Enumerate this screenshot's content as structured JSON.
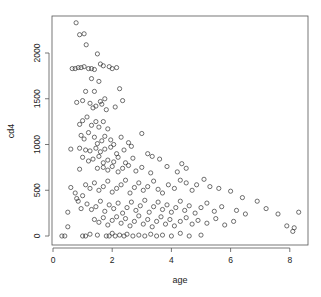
{
  "chart_data": {
    "type": "scatter",
    "title": "",
    "xlabel": "age",
    "ylabel": "cd4",
    "xlim": [
      -0.05,
      8.6
    ],
    "ylim": [
      -100,
      2420
    ],
    "xticks": [
      0,
      2,
      4,
      6,
      8
    ],
    "yticks": [
      0,
      500,
      1000,
      1500,
      2000
    ],
    "grid": false,
    "legend": null,
    "marker": "open-circle",
    "series": [
      {
        "name": "cd4 vs age",
        "points": [
          [
            0.78,
            2330
          ],
          [
            0.9,
            2200
          ],
          [
            1.05,
            2210
          ],
          [
            1.12,
            2090
          ],
          [
            1.5,
            1990
          ],
          [
            2.15,
            1840
          ],
          [
            0.65,
            1830
          ],
          [
            0.75,
            1830
          ],
          [
            0.85,
            1840
          ],
          [
            0.95,
            1840
          ],
          [
            1.05,
            1850
          ],
          [
            1.2,
            1830
          ],
          [
            1.3,
            1830
          ],
          [
            1.4,
            1820
          ],
          [
            1.6,
            1880
          ],
          [
            1.7,
            1860
          ],
          [
            1.9,
            1850
          ],
          [
            2.0,
            1830
          ],
          [
            1.3,
            1720
          ],
          [
            1.55,
            1690
          ],
          [
            1.4,
            1580
          ],
          [
            1.1,
            1580
          ],
          [
            1.0,
            1480
          ],
          [
            1.6,
            1470
          ],
          [
            1.75,
            1500
          ],
          [
            2.25,
            1610
          ],
          [
            0.8,
            1460
          ],
          [
            1.25,
            1450
          ],
          [
            1.35,
            1400
          ],
          [
            1.45,
            1420
          ],
          [
            1.65,
            1440
          ],
          [
            1.8,
            1380
          ],
          [
            2.1,
            1410
          ],
          [
            2.35,
            1480
          ],
          [
            0.9,
            1220
          ],
          [
            1.0,
            1260
          ],
          [
            1.15,
            1300
          ],
          [
            1.3,
            1210
          ],
          [
            1.45,
            1250
          ],
          [
            1.55,
            1190
          ],
          [
            1.7,
            1250
          ],
          [
            1.85,
            1170
          ],
          [
            0.95,
            1100
          ],
          [
            1.05,
            1060
          ],
          [
            1.2,
            1130
          ],
          [
            1.4,
            1080
          ],
          [
            1.5,
            1010
          ],
          [
            1.65,
            1040
          ],
          [
            1.75,
            1090
          ],
          [
            1.95,
            1050
          ],
          [
            2.05,
            1000
          ],
          [
            2.3,
            1080
          ],
          [
            2.55,
            1020
          ],
          [
            3.0,
            1120
          ],
          [
            0.6,
            950
          ],
          [
            0.9,
            960
          ],
          [
            1.1,
            940
          ],
          [
            1.25,
            930
          ],
          [
            1.45,
            960
          ],
          [
            1.6,
            920
          ],
          [
            1.75,
            950
          ],
          [
            1.95,
            970
          ],
          [
            2.15,
            900
          ],
          [
            2.4,
            940
          ],
          [
            2.65,
            980
          ],
          [
            3.2,
            900
          ],
          [
            1.0,
            860
          ],
          [
            1.2,
            820
          ],
          [
            1.35,
            840
          ],
          [
            1.55,
            870
          ],
          [
            1.7,
            800
          ],
          [
            1.85,
            830
          ],
          [
            2.05,
            810
          ],
          [
            2.2,
            860
          ],
          [
            2.45,
            800
          ],
          [
            2.7,
            850
          ],
          [
            3.35,
            870
          ],
          [
            3.6,
            840
          ],
          [
            0.9,
            730
          ],
          [
            1.5,
            740
          ],
          [
            1.7,
            750
          ],
          [
            1.85,
            720
          ],
          [
            2.0,
            760
          ],
          [
            2.2,
            700
          ],
          [
            2.35,
            740
          ],
          [
            2.55,
            770
          ],
          [
            2.8,
            710
          ],
          [
            3.0,
            750
          ],
          [
            3.3,
            690
          ],
          [
            3.85,
            760
          ],
          [
            4.35,
            790
          ],
          [
            4.5,
            740
          ],
          [
            4.2,
            700
          ],
          [
            0.6,
            530
          ],
          [
            0.75,
            470
          ],
          [
            0.85,
            380
          ],
          [
            1.0,
            440
          ],
          [
            0.8,
            410
          ],
          [
            1.1,
            560
          ],
          [
            1.25,
            520
          ],
          [
            1.4,
            580
          ],
          [
            1.55,
            500
          ],
          [
            1.7,
            540
          ],
          [
            1.85,
            600
          ],
          [
            2.0,
            480
          ],
          [
            2.15,
            520
          ],
          [
            2.3,
            560
          ],
          [
            2.45,
            610
          ],
          [
            2.6,
            470
          ],
          [
            2.75,
            530
          ],
          [
            2.9,
            580
          ],
          [
            3.05,
            500
          ],
          [
            3.2,
            540
          ],
          [
            3.4,
            600
          ],
          [
            3.55,
            510
          ],
          [
            3.7,
            470
          ],
          [
            3.9,
            560
          ],
          [
            4.1,
            520
          ],
          [
            4.3,
            610
          ],
          [
            4.5,
            580
          ],
          [
            4.7,
            500
          ],
          [
            4.85,
            560
          ],
          [
            5.1,
            620
          ],
          [
            5.3,
            540
          ],
          [
            5.6,
            520
          ],
          [
            6.0,
            490
          ],
          [
            6.4,
            420
          ],
          [
            6.9,
            380
          ],
          [
            0.5,
            260
          ],
          [
            0.95,
            300
          ],
          [
            1.15,
            350
          ],
          [
            1.3,
            290
          ],
          [
            1.45,
            320
          ],
          [
            1.6,
            380
          ],
          [
            1.75,
            270
          ],
          [
            1.9,
            340
          ],
          [
            2.05,
            300
          ],
          [
            2.2,
            360
          ],
          [
            2.35,
            250
          ],
          [
            2.5,
            310
          ],
          [
            2.65,
            370
          ],
          [
            2.8,
            280
          ],
          [
            2.95,
            330
          ],
          [
            3.1,
            390
          ],
          [
            3.25,
            260
          ],
          [
            3.4,
            320
          ],
          [
            3.55,
            370
          ],
          [
            3.7,
            290
          ],
          [
            3.85,
            340
          ],
          [
            4.0,
            260
          ],
          [
            4.15,
            310
          ],
          [
            4.3,
            380
          ],
          [
            4.45,
            280
          ],
          [
            4.6,
            330
          ],
          [
            4.8,
            250
          ],
          [
            5.0,
            310
          ],
          [
            5.2,
            360
          ],
          [
            5.45,
            270
          ],
          [
            5.7,
            320
          ],
          [
            6.2,
            280
          ],
          [
            6.5,
            240
          ],
          [
            7.2,
            300
          ],
          [
            7.6,
            240
          ],
          [
            8.3,
            260
          ],
          [
            1.4,
            180
          ],
          [
            1.55,
            150
          ],
          [
            1.7,
            200
          ],
          [
            1.85,
            120
          ],
          [
            2.0,
            170
          ],
          [
            2.15,
            210
          ],
          [
            2.3,
            140
          ],
          [
            2.45,
            190
          ],
          [
            2.6,
            110
          ],
          [
            2.75,
            160
          ],
          [
            2.9,
            220
          ],
          [
            3.05,
            130
          ],
          [
            3.2,
            180
          ],
          [
            3.35,
            100
          ],
          [
            3.5,
            160
          ],
          [
            3.65,
            210
          ],
          [
            3.8,
            130
          ],
          [
            3.95,
            180
          ],
          [
            4.1,
            110
          ],
          [
            4.3,
            160
          ],
          [
            4.5,
            200
          ],
          [
            4.7,
            130
          ],
          [
            4.9,
            170
          ],
          [
            5.2,
            140
          ],
          [
            5.5,
            190
          ],
          [
            5.8,
            120
          ],
          [
            6.1,
            160
          ],
          [
            7.9,
            110
          ],
          [
            8.1,
            50
          ],
          [
            8.15,
            90
          ],
          [
            0.3,
            0
          ],
          [
            0.4,
            0
          ],
          [
            0.5,
            100
          ],
          [
            1.0,
            0
          ],
          [
            1.1,
            0
          ],
          [
            1.25,
            20
          ],
          [
            1.5,
            10
          ],
          [
            1.8,
            0
          ],
          [
            1.9,
            0
          ],
          [
            2.0,
            30
          ],
          [
            2.1,
            0
          ],
          [
            2.25,
            10
          ],
          [
            2.4,
            0
          ],
          [
            2.5,
            20
          ],
          [
            2.7,
            0
          ],
          [
            2.9,
            10
          ],
          [
            3.1,
            0
          ],
          [
            3.3,
            20
          ],
          [
            3.5,
            0
          ],
          [
            3.7,
            10
          ],
          [
            4.0,
            0
          ],
          [
            4.3,
            30
          ],
          [
            4.6,
            0
          ],
          [
            5.0,
            10
          ]
        ]
      }
    ]
  },
  "axes": {
    "x_title": "age",
    "y_title": "cd4",
    "x_tick_labels": [
      "0",
      "2",
      "4",
      "6",
      "8"
    ],
    "y_tick_labels": [
      "0",
      "500",
      "1000",
      "1500",
      "2000"
    ]
  }
}
